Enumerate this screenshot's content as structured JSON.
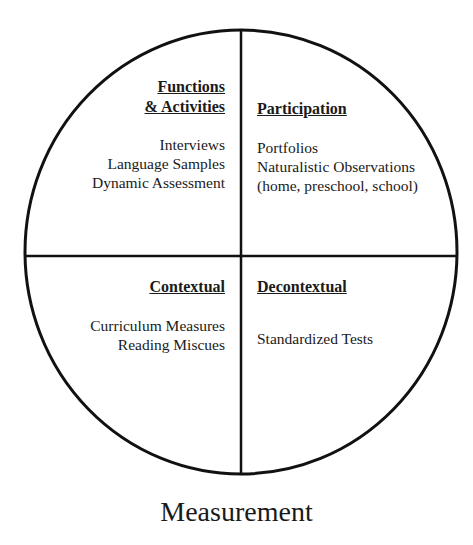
{
  "diagram": {
    "type": "quadrant-circle",
    "caption": "Measurement",
    "stroke_color": "#111111",
    "quadrants": {
      "top_left": {
        "heading_lines": [
          "Functions",
          "& Activities"
        ],
        "items": [
          "Interviews",
          "Language Samples",
          "Dynamic Assessment"
        ]
      },
      "top_right": {
        "heading_lines": [
          "Participation"
        ],
        "items": [
          "Portfolios",
          "Naturalistic Observations",
          "(home, preschool, school)"
        ]
      },
      "bottom_left": {
        "heading_lines": [
          "Contextual"
        ],
        "items": [
          "Curriculum Measures",
          "Reading Miscues"
        ]
      },
      "bottom_right": {
        "heading_lines": [
          "Decontextual"
        ],
        "items": [
          "Standardized Tests"
        ]
      }
    }
  }
}
